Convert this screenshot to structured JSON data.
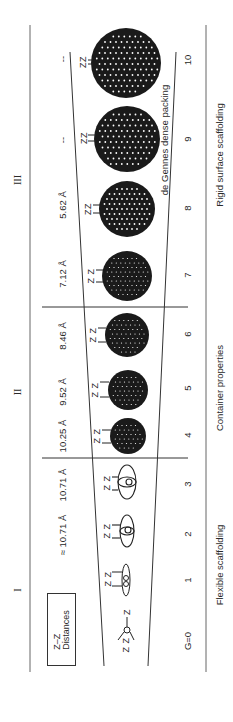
{
  "diagram": {
    "regions": [
      {
        "numeral": "III",
        "title": "Rigid surface scaffolding"
      },
      {
        "numeral": "II",
        "title": "Container properties"
      },
      {
        "numeral": "I",
        "title": "Flexible scaffolding"
      }
    ],
    "legend": {
      "line1": "Z–Z",
      "line2": "Distances"
    },
    "generations": [
      {
        "g": "G=0",
        "distance": "",
        "structure": "small-core-trivalent"
      },
      {
        "g": "1",
        "distance": "",
        "structure": "flat-ellipsoid"
      },
      {
        "g": "2",
        "distance": "≈ 10.71 Å",
        "structure": "ellipsoid"
      },
      {
        "g": "3",
        "distance": "10.71 Å",
        "structure": "ellipsoid"
      },
      {
        "g": "4",
        "distance": "10.25 Å",
        "structure": "sphere"
      },
      {
        "g": "5",
        "distance": "9.52 Å",
        "structure": "sphere"
      },
      {
        "g": "6",
        "distance": "8.46 Å",
        "structure": "sphere"
      },
      {
        "g": "7",
        "distance": "7.12 Å",
        "structure": "sphere"
      },
      {
        "g": "8",
        "distance": "5.62 Å",
        "structure": "sphere"
      },
      {
        "g": "9",
        "distance": "--",
        "structure": "dense-sphere"
      },
      {
        "g": "10",
        "distance": "--",
        "structure": "dense-sphere"
      }
    ],
    "annotation": "de Gennes dense packing",
    "terminal_label": "Z",
    "colors": {
      "ink": "#1a1a1a",
      "line": "#444444",
      "dot": "#ffffff"
    }
  }
}
